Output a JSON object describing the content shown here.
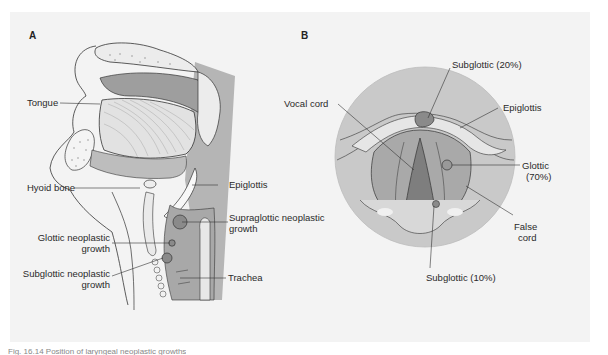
{
  "panel_a": {
    "letter": "A",
    "labels": {
      "tongue": "Tongue",
      "hyoid_bone": "Hyoid bone",
      "epiglottis": "Epiglottis",
      "supraglottic_line1": "Supraglottic neoplastic",
      "supraglottic_line2": "growth",
      "glottic_line1": "Glottic neoplastic",
      "glottic_line2": "growth",
      "subglottic_line1": "Subglottic neoplastic",
      "subglottic_line2": "growth",
      "trachea": "Trachea"
    }
  },
  "panel_b": {
    "letter": "B",
    "labels": {
      "subglottic_top": "Subglottic (20%)",
      "vocal_cord": "Vocal cord",
      "epiglottis": "Epiglottis",
      "glottic_line1": "Glottic",
      "glottic_line2": "(70%)",
      "false_cord_line1": "False",
      "false_cord_line2": "cord",
      "subglottic_bottom": "Subglottic (10%)"
    }
  },
  "caption": "Fig. 16.14  Position of laryngeal neoplastic growths",
  "colors": {
    "panel_bg": "#f3f3f3",
    "tissue_gray": "#b5b5b5",
    "dark_gray": "#8f8f8f",
    "mid_gray": "#a3a3a3",
    "light_gray": "#d3d3d3",
    "tumor": "#8a8a8a",
    "outline": "#333333"
  }
}
